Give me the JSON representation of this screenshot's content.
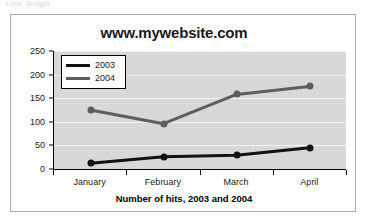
{
  "top_caption": "Line Graph",
  "chart": {
    "title": "www.mywebsite.com",
    "x_axis_title": "Number of hits, 2003 and 2004"
  },
  "legend": {
    "items": [
      {
        "label": "2003",
        "color": "#121212"
      },
      {
        "label": "2004",
        "color": "#5e5e5e"
      }
    ]
  },
  "chart_data": {
    "type": "line",
    "title": "www.mywebsite.com",
    "xlabel": "Number of hits, 2003 and 2004",
    "ylabel": "",
    "categories": [
      "January",
      "February",
      "March",
      "April"
    ],
    "series": [
      {
        "name": "2003",
        "values": [
          12,
          26,
          29,
          45
        ],
        "color": "#121212"
      },
      {
        "name": "2004",
        "values": [
          125,
          96,
          158,
          175
        ],
        "color": "#5e5e5e"
      }
    ],
    "ylim": [
      0,
      250
    ],
    "ytick_labels": [
      "0",
      "50",
      "100",
      "150",
      "200",
      "250"
    ],
    "ytick_values": [
      0,
      50,
      100,
      150,
      200,
      250
    ],
    "grid": true,
    "legend_position": "upper-left-inside",
    "markers": "filled-circle",
    "plot_background": "#d8d8d8"
  }
}
